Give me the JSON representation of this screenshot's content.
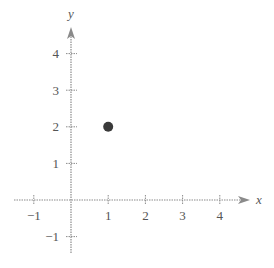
{
  "chart_data": {
    "type": "scatter",
    "title": "",
    "xlabel": "x",
    "ylabel": "y",
    "xlim": [
      -1.5,
      4.8
    ],
    "ylim": [
      -1.5,
      4.8
    ],
    "grid": false,
    "legend": null,
    "x_ticks": [
      -1,
      1,
      2,
      3,
      4
    ],
    "y_ticks": [
      -1,
      1,
      2,
      3,
      4
    ],
    "x_tick_labels": [
      "−1",
      "1",
      "2",
      "3",
      "4"
    ],
    "y_tick_labels": [
      "−1",
      "1",
      "2",
      "3",
      "4"
    ],
    "points": [
      {
        "x": 1,
        "y": 2
      }
    ],
    "colors": {
      "axis": "#8a8a8a",
      "point": "#3a3a3a",
      "text": "#555555"
    }
  }
}
